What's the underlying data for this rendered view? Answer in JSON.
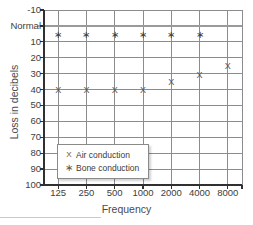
{
  "chart_data": {
    "type": "scatter",
    "title": "",
    "xlabel": "Frequency",
    "ylabel": "Loss in decibels",
    "categories": [
      "125",
      "250",
      "500",
      "1000",
      "2000",
      "4000",
      "8000"
    ],
    "x_tick_labels": [
      "125",
      "250",
      "500",
      "1000",
      "2000",
      "4000",
      "8000"
    ],
    "y_tick_labels": [
      "-10",
      "Normal",
      "10",
      "20",
      "30",
      "40",
      "50",
      "60",
      "70",
      "80",
      "90",
      "100"
    ],
    "y_tick_values": [
      -10,
      0,
      10,
      20,
      30,
      40,
      50,
      60,
      70,
      80,
      90,
      100
    ],
    "ylim": [
      -10,
      100
    ],
    "y_inverted": true,
    "grid": true,
    "legend_position": "inside-lower-left",
    "reference_line": {
      "label": "Normal",
      "value": 0,
      "color": "#999999"
    },
    "series": [
      {
        "name": "Air conduction",
        "marker": "X",
        "x": [
          "125",
          "250",
          "500",
          "1000",
          "2000",
          "4000",
          "8000"
        ],
        "values": [
          40,
          40,
          40,
          40,
          35,
          31,
          25
        ]
      },
      {
        "name": "Bone conduction",
        "marker": "*",
        "x": [
          "125",
          "250",
          "500",
          "1000",
          "2000",
          "4000"
        ],
        "values": [
          6,
          6,
          6,
          6,
          6,
          6
        ]
      }
    ]
  },
  "legend": {
    "entries": [
      {
        "symbol": "X",
        "label": "Air conduction"
      },
      {
        "symbol": "∗",
        "label": "Bone conduction"
      }
    ]
  },
  "axes": {
    "x_title": "Frequency",
    "y_title": "Loss in decibels"
  },
  "colors": {
    "grid": "#8c8c8c",
    "axis": "#303030",
    "marker": "#555555",
    "normal_line": "#9a9a9a",
    "legend_border": "#8a8a8a",
    "bottom_rule": "#c9c9c9"
  }
}
